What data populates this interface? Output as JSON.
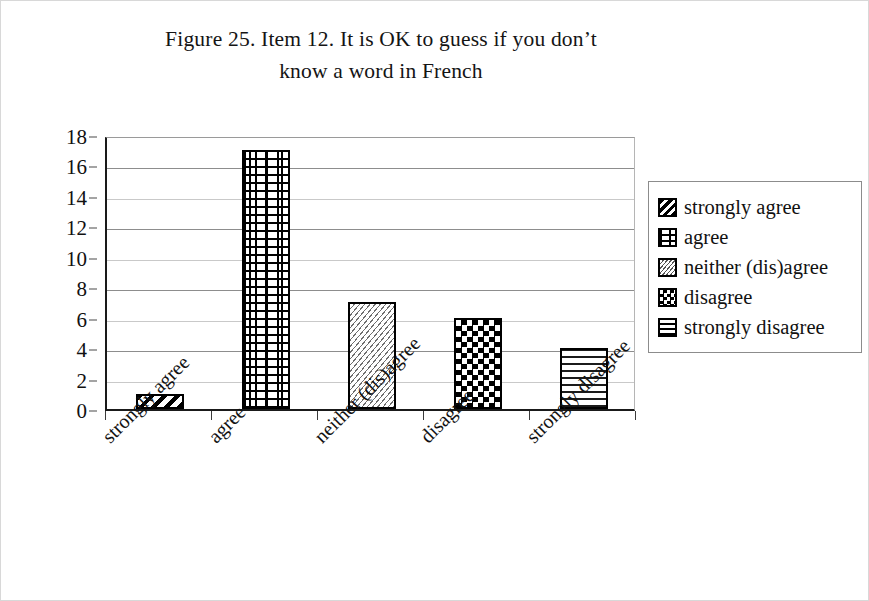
{
  "figure": {
    "title_line_1": "Figure 25. Item 12. It is OK to guess if you don’t",
    "title_line_2": "know a word in French"
  },
  "chart_data": {
    "type": "bar",
    "title": "Figure 25. Item 12. It is OK to guess if you don’t know a word in French",
    "categories": [
      "strongly agree",
      "agree",
      "neither (dis)agree",
      "disagree",
      "strongly disagree"
    ],
    "values": [
      1,
      17,
      7,
      6,
      4
    ],
    "xlabel": "",
    "ylabel": "",
    "ylim": [
      0,
      18
    ],
    "ytick_step": 2,
    "yticks": [
      18,
      16,
      14,
      12,
      10,
      8,
      6,
      4,
      2,
      0
    ],
    "grid": true,
    "grid_axis": "y",
    "legend_position": "right",
    "legend_entries": [
      {
        "label": "strongly agree",
        "pattern": "bold-diagonal-stripes"
      },
      {
        "label": "agree",
        "pattern": "brick"
      },
      {
        "label": "neither (dis)agree",
        "pattern": "fine-diagonal-hatch"
      },
      {
        "label": "disagree",
        "pattern": "checkerboard"
      },
      {
        "label": "strongly disagree",
        "pattern": "horizontal-lines"
      }
    ],
    "bar_fill": "#ffffff",
    "bar_outline": "#000000",
    "gridline_color": "#8d8d8d",
    "axis_color": "#1a1a1a",
    "background": "#ffffff",
    "xtick_label_rotation_deg": -45
  }
}
